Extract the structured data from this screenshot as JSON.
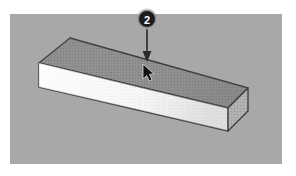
{
  "figure": {
    "canvas": {
      "background_color": "#a8a8a8",
      "page_background_color": "#ffffff",
      "x": 10,
      "y": 14,
      "width": 272,
      "height": 150
    },
    "callout": {
      "step_number": "2",
      "badge_fill_color": "#1c1c1c",
      "badge_text_color": "#ffffff",
      "badge_ring_color": "#8d8d8d",
      "arrow_color": "#2a2a2a",
      "arrow_direction": "down",
      "points_to": "top-face-of-box"
    },
    "cursor": {
      "type": "arrow-pointer",
      "color": "#111111",
      "x": 143,
      "y": 66
    },
    "object": {
      "name": "rectangular-beam",
      "projection": "isometric",
      "top_face_color": "#8e8e8e",
      "front_face_color": "#f2f2f2",
      "right_face_color": "#adadad",
      "edge_color": "#3a3a3a",
      "texture": "stipple-dots",
      "vertices": {
        "top_back_left": [
          70,
          38
        ],
        "top_back_right": [
          248,
          88
        ],
        "top_front_right": [
          228,
          108
        ],
        "top_front_left": [
          39,
          63
        ],
        "bottom_front_left": [
          39,
          87
        ],
        "bottom_front_right": [
          228,
          131
        ],
        "bottom_back_right": [
          248,
          111
        ]
      }
    }
  }
}
